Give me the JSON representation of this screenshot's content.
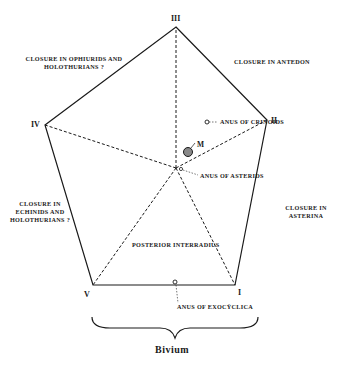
{
  "figure": {
    "type": "pentagon-diagram",
    "colors": {
      "ink": "#1a1a1a",
      "background": "#ffffff"
    },
    "vertices": [
      {
        "id": "III",
        "label": "III"
      },
      {
        "id": "II",
        "label": "II"
      },
      {
        "id": "I",
        "label": "I"
      },
      {
        "id": "V",
        "label": "V"
      },
      {
        "id": "IV",
        "label": "IV"
      }
    ],
    "labels": {
      "ophiurids": {
        "line1": "Closure in Ophiurids and",
        "line2": "Holothurians ?"
      },
      "antedon": {
        "line1": "Closure in Antedon"
      },
      "crinoids": {
        "line1": "Anus of Crinoids"
      },
      "mouth": {
        "line1": "M"
      },
      "asterids": {
        "line1": "Anus of Asterids"
      },
      "echinids": {
        "line1": "Closure in",
        "line2": "Echinids and",
        "line3": "Holothurians ?"
      },
      "asterina": {
        "line1": "Closure in",
        "line2": "Asterina"
      },
      "posterior": {
        "line1": "Posterior interradius"
      },
      "exocyclica": {
        "line1": "Anus of Exocÿclica"
      }
    },
    "bracket_label": "Bivium"
  }
}
